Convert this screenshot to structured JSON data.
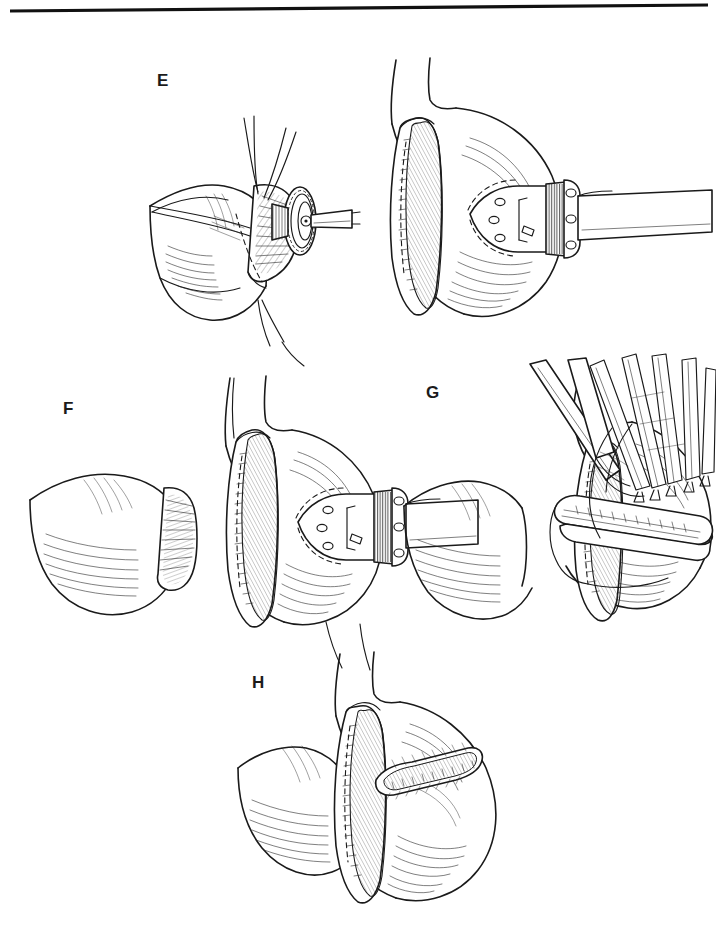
{
  "figure": {
    "kind": "surgical-line-illustration",
    "background_color": "#ffffff",
    "ink_color": "#1a1a1a",
    "width": 716,
    "height": 930,
    "top_rule": {
      "name": "horizontal-rule",
      "x1": 10,
      "y1": 11,
      "x2": 708,
      "y2": 5,
      "thickness": 3,
      "color": "#111111"
    },
    "panels": [
      {
        "id": "E",
        "label": "E",
        "label_x": 157,
        "label_y": 72,
        "caption": "Purse-string sutured bowel end with circular stapler anvil advanced toward the gastric pouch staple line",
        "elements": [
          "bowel-segment",
          "purse-string-sutures",
          "stapler-anvil-head",
          "anvil-shaft",
          "gastric-pouch",
          "linear-staple-line",
          "circular-stapler-cartridge",
          "stapler-shaft"
        ]
      },
      {
        "id": "F",
        "label": "F",
        "label_x": 63,
        "label_y": 400,
        "caption": "Anvil seated and bowel end approximated against the gastric pouch before firing",
        "elements": [
          "bowel-segment",
          "gastric-pouch",
          "linear-staple-line",
          "circular-stapler-cartridge",
          "stapler-shaft",
          "suture-tail"
        ]
      },
      {
        "id": "G",
        "label": "G",
        "label_x": 426,
        "label_y": 384,
        "caption": "Gastrotomy closed with a linear stapler while tissue is held by Allis clamps",
        "elements": [
          "bowel-segment",
          "gastric-pouch",
          "linear-staple-line",
          "linear-stapler-jaw",
          "allis-clamps",
          "retractor-arm"
        ]
      },
      {
        "id": "H",
        "label": "H",
        "label_x": 252,
        "label_y": 674,
        "caption": "Completed anastomosis showing the vertical pouch staple line and the transverse closure staple line",
        "elements": [
          "bowel-segment",
          "gastric-pouch",
          "vertical-staple-line",
          "transverse-staple-line"
        ]
      }
    ]
  }
}
